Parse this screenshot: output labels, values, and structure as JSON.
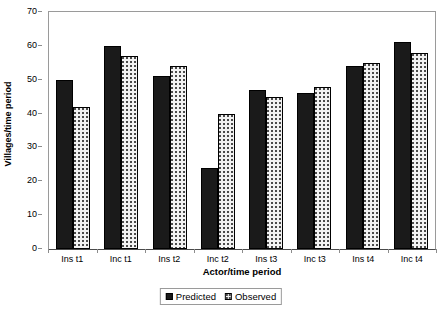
{
  "chart_data": {
    "type": "bar",
    "title": "",
    "xlabel": "Actor/time period",
    "ylabel": "Villages/time period",
    "ylim": [
      0,
      70
    ],
    "ytick_step": 10,
    "yticks": [
      0,
      10,
      20,
      30,
      40,
      50,
      60,
      70
    ],
    "grid": false,
    "legend_position": "bottom-center",
    "categories": [
      "Ins t1",
      "Inc t1",
      "Ins t2",
      "Inc t2",
      "Ins t3",
      "Inc t3",
      "Ins t4",
      "Inc t4"
    ],
    "series": [
      {
        "name": "Predicted",
        "values": [
          50,
          60,
          51,
          24,
          47,
          46,
          54,
          61
        ],
        "color": "#1a1a1a",
        "fill": "solid"
      },
      {
        "name": "Observed",
        "values": [
          42,
          57,
          54,
          40,
          45,
          48,
          55,
          58
        ],
        "color": "#f2f2f2",
        "fill": "dotted"
      }
    ]
  },
  "axes": {
    "y_title": "Villages/time period",
    "x_title": "Actor/time period",
    "y_tick_labels": [
      "70",
      "60",
      "50",
      "40",
      "30",
      "20",
      "10",
      "0"
    ],
    "x_tick_labels": [
      "Ins t1",
      "Inc t1",
      "Ins t2",
      "Inc t2",
      "Ins t3",
      "Inc t3",
      "Ins t4",
      "Inc t4"
    ]
  },
  "legend": {
    "entries": [
      {
        "label": "Predicted"
      },
      {
        "label": "Observed"
      }
    ]
  }
}
